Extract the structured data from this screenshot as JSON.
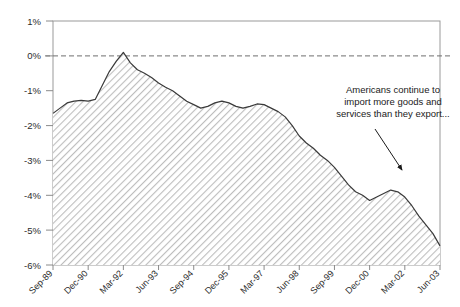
{
  "chart_data": {
    "type": "area",
    "title": "",
    "xlabel": "",
    "ylabel": "",
    "ylim": [
      -6,
      1
    ],
    "grid": false,
    "zero_reference_line": true,
    "legend": "none",
    "y_tick_labels": [
      "1%",
      "0%",
      "-1%",
      "-2%",
      "-3%",
      "-4%",
      "-5%",
      "-6%"
    ],
    "y_tick_values": [
      1,
      0,
      -1,
      -2,
      -3,
      -4,
      -5,
      -6
    ],
    "x_tick_labels": [
      "Sep-89",
      "Dec-90",
      "Mar-92",
      "Jun-93",
      "Sep-94",
      "Dec-95",
      "Mar-97",
      "Jun-98",
      "Sep-99",
      "Dec-00",
      "Mar-02",
      "Jun-03"
    ],
    "categories": [
      "Sep-89",
      "Dec-89",
      "Mar-90",
      "Jun-90",
      "Sep-90",
      "Dec-90",
      "Mar-91",
      "Jun-91",
      "Sep-91",
      "Dec-91",
      "Mar-92",
      "Jun-92",
      "Sep-92",
      "Dec-92",
      "Mar-93",
      "Jun-93",
      "Sep-93",
      "Dec-93",
      "Mar-94",
      "Jun-94",
      "Sep-94",
      "Dec-94",
      "Mar-95",
      "Jun-95",
      "Sep-95",
      "Dec-95",
      "Mar-96",
      "Jun-96",
      "Sep-96",
      "Dec-96",
      "Mar-97",
      "Jun-97",
      "Sep-97",
      "Dec-97",
      "Mar-98",
      "Jun-98",
      "Sep-98",
      "Dec-98",
      "Mar-99",
      "Jun-99",
      "Sep-99",
      "Dec-99",
      "Mar-00",
      "Jun-00",
      "Sep-00",
      "Dec-00",
      "Mar-01",
      "Jun-01",
      "Sep-01",
      "Dec-01",
      "Mar-02",
      "Jun-02",
      "Sep-02",
      "Dec-02",
      "Mar-03",
      "Jun-03"
    ],
    "values": [
      -1.65,
      -1.5,
      -1.35,
      -1.3,
      -1.28,
      -1.3,
      -1.25,
      -0.85,
      -0.45,
      -0.15,
      0.1,
      -0.2,
      -0.4,
      -0.5,
      -0.62,
      -0.78,
      -0.9,
      -1.0,
      -1.15,
      -1.3,
      -1.4,
      -1.5,
      -1.45,
      -1.35,
      -1.3,
      -1.35,
      -1.45,
      -1.5,
      -1.45,
      -1.38,
      -1.4,
      -1.5,
      -1.6,
      -1.75,
      -2.0,
      -2.3,
      -2.5,
      -2.65,
      -2.85,
      -3.0,
      -3.2,
      -3.45,
      -3.7,
      -3.9,
      -4.0,
      -4.15,
      -4.05,
      -3.95,
      -3.85,
      -3.9,
      -4.05,
      -4.3,
      -4.6,
      -4.85,
      -5.1,
      -5.45
    ],
    "series_style": {
      "line_color": "#3a3a3a",
      "fill_pattern": "diagonal-hatch",
      "fill_color": "#b8b8b8"
    },
    "annotations": [
      {
        "text_lines": [
          "Americans continue to",
          "import more goods and",
          "services than they export..."
        ],
        "arrow": {
          "from_x": 375,
          "from_y": 130,
          "to_x": 403,
          "to_y": 172
        }
      }
    ]
  },
  "axis": {
    "y_labels": [
      "1%",
      "0%",
      "-1%",
      "-2%",
      "-3%",
      "-4%",
      "-5%",
      "-6%"
    ],
    "x_labels": [
      "Sep-89",
      "Dec-90",
      "Mar-92",
      "Jun-93",
      "Sep-94",
      "Dec-95",
      "Mar-97",
      "Jun-98",
      "Sep-99",
      "Dec-00",
      "Mar-02",
      "Jun-03"
    ]
  },
  "annotation": {
    "line1": "Americans continue to",
    "line2": "import more goods and",
    "line3": "services than they export..."
  },
  "colors": {
    "line": "#3a3a3a",
    "hatch": "#b4b4b4",
    "axis": "#8a8a8a",
    "text": "#2b2b2b"
  }
}
